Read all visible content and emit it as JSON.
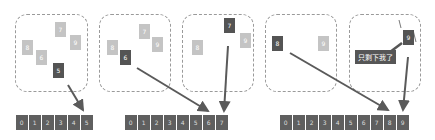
{
  "colors": {
    "light_card": "#c4c4c4",
    "dark_card": "#545454",
    "array_cell": "#5f5f5f",
    "arrow": "#5a5a5a",
    "dashed_border": "#9a9a9a"
  },
  "panels": [
    {
      "boxes": [
        {
          "cards": [
            {
              "label": "7",
              "style": "light",
              "x": 55,
              "y": 22
            },
            {
              "label": "9",
              "style": "light",
              "x": 70,
              "y": 35
            },
            {
              "label": "8",
              "style": "light",
              "x": 22,
              "y": 40
            },
            {
              "label": "6",
              "style": "light",
              "x": 36,
              "y": 50
            },
            {
              "label": "5",
              "style": "dark",
              "x": 53,
              "y": 63
            }
          ]
        }
      ],
      "array": [
        "0",
        "1",
        "2",
        "3",
        "4",
        "5"
      ]
    },
    {
      "boxes": [
        {
          "cards": [
            {
              "label": "7",
              "style": "light",
              "x": 139,
              "y": 24
            },
            {
              "label": "9",
              "style": "light",
              "x": 152,
              "y": 37
            },
            {
              "label": "8",
              "style": "light",
              "x": 107,
              "y": 40
            },
            {
              "label": "6",
              "style": "dark",
              "x": 120,
              "y": 50
            }
          ]
        },
        {
          "cards": [
            {
              "label": "7",
              "style": "dark",
              "x": 224,
              "y": 18
            },
            {
              "label": "9",
              "style": "light",
              "x": 240,
              "y": 33
            },
            {
              "label": "8",
              "style": "light",
              "x": 192,
              "y": 40
            }
          ]
        }
      ],
      "array": [
        "0",
        "1",
        "2",
        "3",
        "4",
        "5",
        "6",
        "7"
      ]
    },
    {
      "boxes": [
        {
          "cards": [
            {
              "label": "8",
              "style": "dark",
              "x": 272,
              "y": 36
            },
            {
              "label": "9",
              "style": "light",
              "x": 318,
              "y": 36
            }
          ]
        },
        {
          "cards": [
            {
              "label": "9",
              "style": "dark",
              "x": 403,
              "y": 30
            }
          ]
        }
      ],
      "callout": "只剩下我了",
      "array": [
        "0",
        "1",
        "2",
        "3",
        "4",
        "5",
        "6",
        "7",
        "8",
        "9"
      ]
    }
  ]
}
